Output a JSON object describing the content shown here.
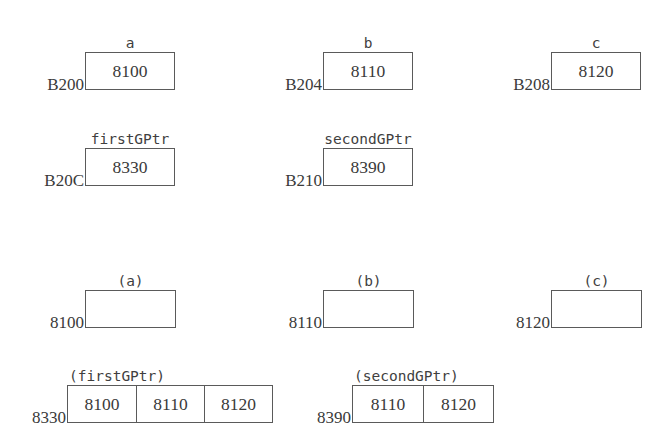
{
  "diagram": {
    "background": "#ffffff",
    "border_color": "#5a5a5a",
    "text_color": "#3a3a3a",
    "rows": [
      {
        "name": "variables-row",
        "units": [
          {
            "name": "var-a",
            "address": "B200",
            "caption": "a",
            "caption_style": "mono",
            "cells": [
              "8100"
            ],
            "x": 85,
            "y": 52,
            "cell_width": 88
          },
          {
            "name": "var-b",
            "address": "B204",
            "caption": "b",
            "caption_style": "mono",
            "cells": [
              "8110"
            ],
            "x": 323,
            "y": 52,
            "cell_width": 88
          },
          {
            "name": "var-c",
            "address": "B208",
            "caption": "c",
            "caption_style": "mono",
            "cells": [
              "8120"
            ],
            "x": 551,
            "y": 52,
            "cell_width": 88
          }
        ]
      },
      {
        "name": "pointer-variables-row",
        "units": [
          {
            "name": "var-firstgptr",
            "address": "B20C",
            "caption": "firstGPtr",
            "caption_style": "mono",
            "cells": [
              "8330"
            ],
            "x": 85,
            "y": 148,
            "cell_width": 88
          },
          {
            "name": "var-secondgptr",
            "address": "B210",
            "caption": "secondGPtr",
            "caption_style": "mono",
            "cells": [
              "8390"
            ],
            "x": 323,
            "y": 148,
            "cell_width": 88
          }
        ]
      },
      {
        "name": "dereferenced-targets-row",
        "units": [
          {
            "name": "target-a",
            "address": "8100",
            "caption": "(a)",
            "caption_style": "mono",
            "cells": [
              ""
            ],
            "x": 85,
            "y": 290,
            "cell_width": 89
          },
          {
            "name": "target-b",
            "address": "8110",
            "caption": "(b)",
            "caption_style": "mono",
            "cells": [
              ""
            ],
            "x": 323,
            "y": 290,
            "cell_width": 89
          },
          {
            "name": "target-c",
            "address": "8120",
            "caption": "(c)",
            "caption_style": "mono",
            "cells": [
              ""
            ],
            "x": 551,
            "y": 290,
            "cell_width": 89
          }
        ]
      },
      {
        "name": "pointer-arrays-row",
        "units": [
          {
            "name": "array-firstgptr",
            "address": "8330",
            "caption": "(firstGPtr)",
            "caption_style": "mono",
            "cells": [
              "8100",
              "8110",
              "8120"
            ],
            "x": 67,
            "y": 385,
            "cell_width": 68
          },
          {
            "name": "array-secondgptr",
            "address": "8390",
            "caption": "(secondGPtr)",
            "caption_style": "mono",
            "cells": [
              "8110",
              "8120"
            ],
            "x": 352,
            "y": 385,
            "cell_width": 70
          }
        ]
      }
    ]
  }
}
